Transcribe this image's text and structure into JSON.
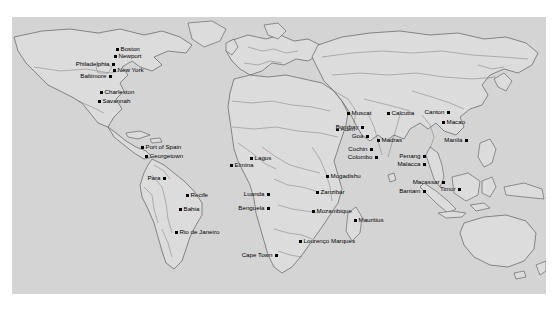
{
  "map": {
    "title": "World map of early-modern trading ports",
    "panel": {
      "background_color": "#d4d4d4",
      "land_fill": "#dcdcdc",
      "coast_stroke": "#4a4a4a",
      "border_stroke": "#6e6e6e",
      "outer_background": "#ffffff",
      "left": 12,
      "top": 17,
      "width": 534,
      "height": 277
    },
    "marker": {
      "color": "#000000",
      "size_px": 3,
      "shape": "square-dot"
    },
    "label": {
      "color": "#000000",
      "font_size_px": 6.2
    },
    "regions": [
      "North America",
      "South America",
      "West Africa",
      "East Africa",
      "Southern Africa",
      "Arabia",
      "South Asia",
      "Southeast Asia",
      "East Asia"
    ],
    "cities": [
      {
        "name": "Boston",
        "x": 117,
        "y": 49,
        "align": "right"
      },
      {
        "name": "Newport",
        "x": 115,
        "y": 56,
        "align": "right"
      },
      {
        "name": "Philadelphia",
        "x": 113,
        "y": 64,
        "align": "left"
      },
      {
        "name": "New York",
        "x": 114,
        "y": 70,
        "align": "right"
      },
      {
        "name": "Baltimore",
        "x": 110,
        "y": 76,
        "align": "left"
      },
      {
        "name": "Charleston",
        "x": 101,
        "y": 92,
        "align": "right"
      },
      {
        "name": "Savannah",
        "x": 99,
        "y": 101,
        "align": "right"
      },
      {
        "name": "Port of Spain",
        "x": 142,
        "y": 147,
        "align": "right"
      },
      {
        "name": "Georgetown",
        "x": 146,
        "y": 156,
        "align": "right"
      },
      {
        "name": "Para",
        "x": 164,
        "y": 178,
        "align": "left"
      },
      {
        "name": "Recife",
        "x": 187,
        "y": 195,
        "align": "right"
      },
      {
        "name": "Bahia",
        "x": 180,
        "y": 209,
        "align": "right"
      },
      {
        "name": "Rio de Janeiro",
        "x": 176,
        "y": 232,
        "align": "right"
      },
      {
        "name": "Elmina",
        "x": 231,
        "y": 165,
        "align": "right"
      },
      {
        "name": "Lagos",
        "x": 251,
        "y": 158,
        "align": "right"
      },
      {
        "name": "Luanda",
        "x": 268,
        "y": 194,
        "align": "left"
      },
      {
        "name": "Benguela",
        "x": 268,
        "y": 208,
        "align": "left"
      },
      {
        "name": "Cape Town",
        "x": 276,
        "y": 255,
        "align": "left"
      },
      {
        "name": "Lourenço Marques",
        "x": 300,
        "y": 241,
        "align": "right"
      },
      {
        "name": "Mozambique",
        "x": 313,
        "y": 211,
        "align": "right"
      },
      {
        "name": "Mauritius",
        "x": 355,
        "y": 220,
        "align": "right"
      },
      {
        "name": "Mogadishu",
        "x": 327,
        "y": 176,
        "align": "right"
      },
      {
        "name": "Zanzibar",
        "x": 317,
        "y": 192,
        "align": "right"
      },
      {
        "name": "Aden",
        "x": 337,
        "y": 129,
        "align": "right"
      },
      {
        "name": "Muscat",
        "x": 348,
        "y": 113,
        "align": "right"
      },
      {
        "name": "Calcutta",
        "x": 388,
        "y": 113,
        "align": "right"
      },
      {
        "name": "Bombay",
        "x": 362,
        "y": 127,
        "align": "left"
      },
      {
        "name": "Goa",
        "x": 367,
        "y": 136,
        "align": "left"
      },
      {
        "name": "Madras",
        "x": 378,
        "y": 140,
        "align": "right"
      },
      {
        "name": "Cochin",
        "x": 371,
        "y": 149,
        "align": "left"
      },
      {
        "name": "Colombo",
        "x": 376,
        "y": 157,
        "align": "left"
      },
      {
        "name": "Penang",
        "x": 424,
        "y": 156,
        "align": "left"
      },
      {
        "name": "Malacca",
        "x": 424,
        "y": 164,
        "align": "left"
      },
      {
        "name": "Macassar",
        "x": 443,
        "y": 182,
        "align": "left"
      },
      {
        "name": "Bantam",
        "x": 424,
        "y": 191,
        "align": "left"
      },
      {
        "name": "Timor",
        "x": 459,
        "y": 189,
        "align": "left"
      },
      {
        "name": "Canton",
        "x": 448,
        "y": 112,
        "align": "left"
      },
      {
        "name": "Macao",
        "x": 443,
        "y": 122,
        "align": "right"
      },
      {
        "name": "Manila",
        "x": 466,
        "y": 140,
        "align": "left"
      }
    ]
  }
}
